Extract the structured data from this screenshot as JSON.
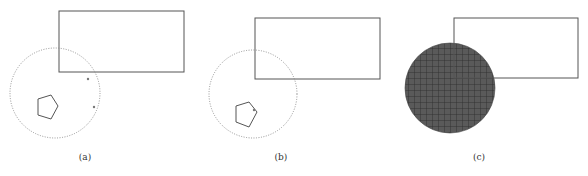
{
  "panels": [
    {
      "id": "a",
      "label": "(a)",
      "rect": {
        "x": 59,
        "y": 11,
        "w": 125,
        "h": 61
      },
      "circle": {
        "cx": 55,
        "cy": 93,
        "r": 45,
        "style": "dotted"
      },
      "pentagon": [
        [
          38,
          99
        ],
        [
          51,
          95
        ],
        [
          58,
          106
        ],
        [
          51,
          119
        ],
        [
          38,
          115
        ]
      ],
      "dots": [
        [
          94,
          107
        ],
        [
          88,
          79
        ]
      ]
    },
    {
      "id": "b",
      "label": "(b)",
      "rect": {
        "x": 255,
        "y": 18,
        "w": 125,
        "h": 61
      },
      "circle": {
        "cx": 253,
        "cy": 94,
        "r": 44,
        "style": "dotted"
      },
      "pentagon": [
        [
          236,
          106
        ],
        [
          249,
          102
        ],
        [
          257,
          112
        ],
        [
          249,
          127
        ],
        [
          236,
          122
        ]
      ],
      "dots": [
        [
          254,
          110
        ]
      ]
    },
    {
      "id": "c",
      "label": "(c)",
      "rect": {
        "x": 454,
        "y": 18,
        "w": 124,
        "h": 60
      },
      "circle": {
        "cx": 450,
        "cy": 88,
        "r": 45,
        "style": "filled-grid"
      },
      "fill_color": "#555555",
      "grid_color": "#2a2a2a"
    }
  ],
  "colors": {
    "stroke": "#555555",
    "dotted": "#888888",
    "label": "#333333"
  }
}
